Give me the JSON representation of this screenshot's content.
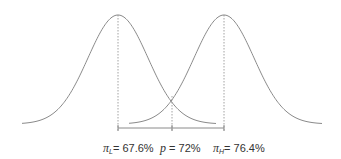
{
  "diagram": {
    "type": "two overlapping normal distributions",
    "curves": [
      {
        "name": "low",
        "mean_label": "π_L",
        "mean_value": "67.6%",
        "peak_x": 118
      },
      {
        "name": "high",
        "mean_label": "π_H",
        "mean_value": "76.4%",
        "peak_x": 224
      }
    ],
    "threshold": {
      "label": "p",
      "value": "72%",
      "x": 172
    }
  },
  "labels": {
    "pi_l_symbol": "π",
    "pi_l_sub": "L",
    "pi_l_value": "= 67.6%",
    "p_symbol": "p",
    "p_value": " = 72%",
    "pi_h_symbol": "π",
    "pi_h_sub": "H",
    "pi_h_value": "= 76.4%"
  },
  "colors": {
    "line": "#8a8a8a",
    "text": "#333333"
  }
}
